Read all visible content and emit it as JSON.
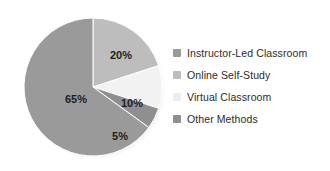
{
  "chart_data": {
    "type": "pie",
    "title": "",
    "subtitle": "",
    "xlabel": "",
    "ylabel": "",
    "legend_position": "right",
    "grid": false,
    "start_angle_deg": 0,
    "direction": "clockwise",
    "unit": "%",
    "categories": [
      "Instructor-Led Classroom",
      "Online Self-Study",
      "Virtual Classroom",
      "Other Methods"
    ],
    "values": [
      65,
      20,
      10,
      5
    ],
    "slice_labels": [
      "65%",
      "20%",
      "10%",
      "5%"
    ],
    "colors": [
      "#9a9a9a",
      "#bdbdbd",
      "#f2f2f2",
      "#8f8f8f"
    ],
    "slices": [
      {
        "label": "Instructor-Led Classroom",
        "value": 65,
        "display": "65%",
        "color": "#9a9a9a",
        "label_x": 56,
        "label_y": 90
      },
      {
        "label": "Online Self-Study",
        "value": 20,
        "display": "20%",
        "color": "#bdbdbd",
        "label_x": 101,
        "label_y": 46
      },
      {
        "label": "Virtual Classroom",
        "value": 10,
        "display": "10%",
        "color": "#f2f2f2",
        "label_x": 112,
        "label_y": 94
      },
      {
        "label": "Other Methods",
        "value": 5,
        "display": "5%",
        "color": "#8f8f8f",
        "label_x": 100,
        "label_y": 127
      }
    ]
  },
  "legend": {
    "items": [
      {
        "label": "Instructor-Led Classroom",
        "color": "#9a9a9a"
      },
      {
        "label": "Online Self-Study",
        "color": "#bdbdbd"
      },
      {
        "label": "Virtual Classroom",
        "color": "#ededed"
      },
      {
        "label": "Other Methods",
        "color": "#8f8f8f"
      }
    ]
  }
}
